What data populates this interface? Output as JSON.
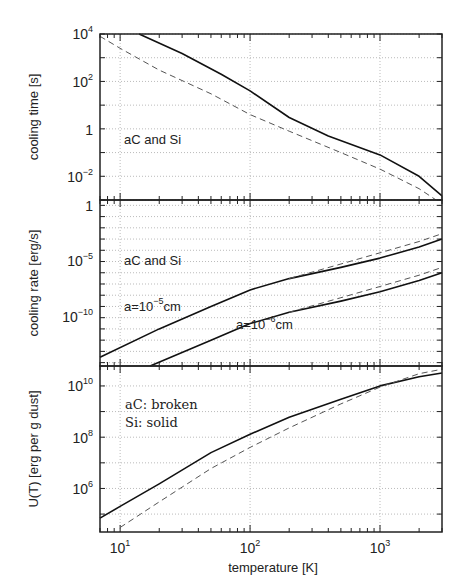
{
  "chart_data": [
    {
      "type": "line",
      "panel": "top",
      "ylabel": "cooling time [s]",
      "xlabel": "",
      "xscale": "log",
      "yscale": "log",
      "xlim": [
        7,
        3000
      ],
      "ylim": [
        0.001,
        10000
      ],
      "yticks": [
        "10^-2",
        "1",
        "10^2",
        "10^4"
      ],
      "grid": true,
      "annotation": "aC and Si",
      "series": [
        {
          "name": "aC (solid)",
          "style": "solid",
          "x": [
            14,
            30,
            60,
            100,
            200,
            400,
            1000,
            2000,
            3000
          ],
          "y": [
            10000,
            1500,
            200,
            40,
            3,
            0.5,
            0.08,
            0.01,
            0.0015
          ]
        },
        {
          "name": "Si (dashed)",
          "style": "dashed",
          "x": [
            7,
            10,
            20,
            50,
            100,
            200,
            500,
            1000,
            2000,
            2700
          ],
          "y": [
            8000,
            2500,
            300,
            30,
            4,
            0.8,
            0.1,
            0.02,
            0.003,
            0.001
          ]
        }
      ]
    },
    {
      "type": "line",
      "panel": "middle",
      "ylabel": "cooling rate [erg/s]",
      "xlabel": "",
      "xscale": "log",
      "yscale": "log",
      "xlim": [
        7,
        3000
      ],
      "ylim": [
        5e-15,
        3
      ],
      "yticks": [
        "10^-10",
        "10^-5",
        "1"
      ],
      "grid": true,
      "annotations": [
        "aC and Si",
        "a=10^-5cm",
        "a=10^-6cm"
      ],
      "series": [
        {
          "name": "a=1e-5 cm aC (solid)",
          "style": "solid",
          "x": [
            7,
            20,
            50,
            100,
            200,
            500,
            1000,
            2000,
            3000
          ],
          "y": [
            3e-14,
            1e-11,
            1e-09,
            3e-08,
            3e-07,
            3e-06,
            2e-05,
            0.0002,
            0.001
          ]
        },
        {
          "name": "a=1e-5 cm Si (dashed)",
          "style": "dashed",
          "x": [
            200,
            500,
            1000,
            2000,
            3000
          ],
          "y": [
            3e-07,
            6e-06,
            6e-05,
            0.0006,
            0.003
          ]
        },
        {
          "name": "a=1e-6 cm aC (solid)",
          "style": "solid",
          "x": [
            17,
            50,
            100,
            200,
            500,
            1000,
            2000,
            3000
          ],
          "y": [
            5e-15,
            1e-12,
            3e-11,
            3e-10,
            3e-09,
            2e-08,
            2e-07,
            1e-06
          ]
        },
        {
          "name": "a=1e-6 cm Si (dashed)",
          "style": "dashed",
          "x": [
            200,
            500,
            1000,
            2000,
            3000
          ],
          "y": [
            3e-10,
            6e-09,
            6e-08,
            6e-07,
            3e-06
          ]
        }
      ]
    },
    {
      "type": "line",
      "panel": "bottom",
      "ylabel": "U(T) [erg per g dust]",
      "xlabel": "temperature [K]",
      "xscale": "log",
      "yscale": "log",
      "xlim": [
        7,
        3000
      ],
      "ylim": [
        20000,
        60000000000.0
      ],
      "xticks": [
        "10^1",
        "10^2",
        "10^3"
      ],
      "yticks": [
        "10^6",
        "10^8",
        "10^10"
      ],
      "grid": true,
      "annotations": [
        "aC: broken",
        "Si: solid"
      ],
      "series": [
        {
          "name": "Si (solid)",
          "style": "solid",
          "x": [
            7,
            10,
            20,
            50,
            100,
            200,
            500,
            1000,
            2000,
            3000
          ],
          "y": [
            70000,
            200000,
            1500000.0,
            25000000.0,
            130000000.0,
            600000000.0,
            3000000000.0,
            10000000000.0,
            23000000000.0,
            32000000000.0
          ]
        },
        {
          "name": "aC (broken)",
          "style": "dashed",
          "x": [
            10,
            20,
            50,
            100,
            200,
            500,
            1000,
            2000,
            3000
          ],
          "y": [
            30000,
            300000,
            6000000.0,
            40000000.0,
            230000000.0,
            2000000000.0,
            9000000000.0,
            30000000000.0,
            45000000000.0
          ]
        }
      ]
    }
  ],
  "labels": {
    "panel1_ylabel": "cooling time [s]",
    "panel2_ylabel": "cooling rate [erg/s]",
    "panel3_ylabel": "U(T) [erg per g dust]",
    "xlabel": "temperature [K]",
    "panel1_annotation": "aC and Si",
    "panel2_annotation": "aC and Si",
    "panel2_curve1": "a=10",
    "panel2_curve1_exp": "−5",
    "panel2_curve1_unit": "cm",
    "panel2_curve2": "a=10",
    "panel2_curve2_exp": "−6",
    "panel2_curve2_unit": "cm",
    "panel3_annotation1": "aC: broken",
    "panel3_annotation2": "Si: solid"
  },
  "ticks": {
    "x": [
      {
        "base": "10",
        "exp": "1"
      },
      {
        "base": "10",
        "exp": "2"
      },
      {
        "base": "10",
        "exp": "3"
      }
    ],
    "p1": [
      {
        "base": "10",
        "exp": "4"
      },
      {
        "base": "10",
        "exp": "2"
      },
      {
        "base": "1",
        "exp": ""
      },
      {
        "base": "10",
        "exp": "−2"
      }
    ],
    "p2": [
      {
        "base": "1",
        "exp": ""
      },
      {
        "base": "10",
        "exp": "−5"
      },
      {
        "base": "10",
        "exp": "−10"
      }
    ],
    "p3": [
      {
        "base": "10",
        "exp": "10"
      },
      {
        "base": "10",
        "exp": "8"
      },
      {
        "base": "10",
        "exp": "6"
      }
    ]
  }
}
